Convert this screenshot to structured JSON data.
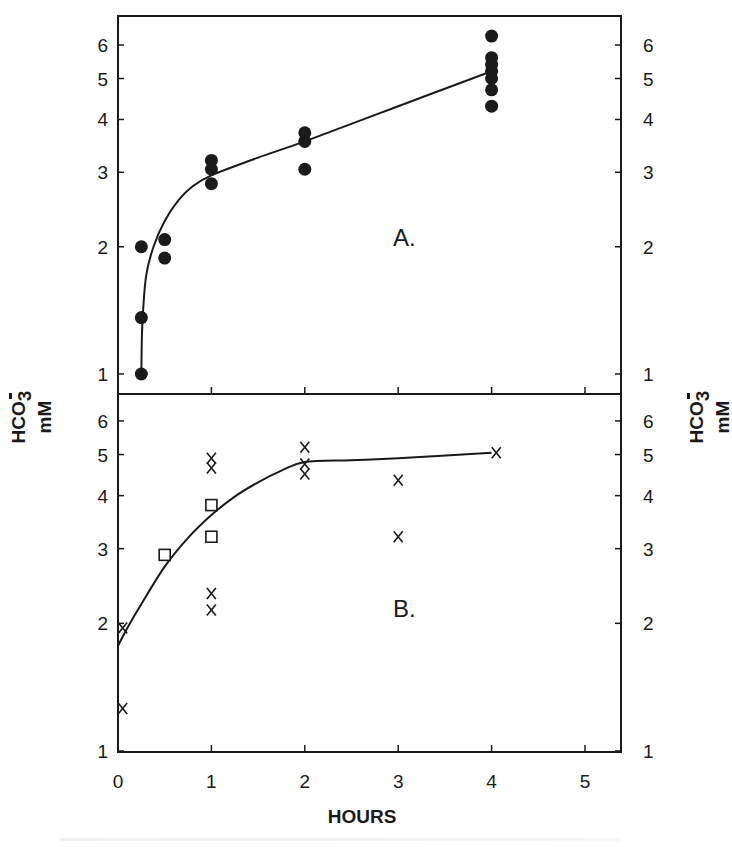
{
  "figure": {
    "x_axis": {
      "label": "HOURS",
      "ticks": [
        "0",
        "1",
        "2",
        "3",
        "4",
        "5"
      ]
    },
    "y_axis": {
      "label_main": "HCO",
      "label_sub": "3",
      "label_sup": "−",
      "label_unit": "mM",
      "ticks": [
        "1",
        "2",
        "3",
        "4",
        "5",
        "6"
      ]
    },
    "panel_a": {
      "label": "A."
    },
    "panel_b": {
      "label": "B."
    }
  },
  "chart_data": [
    {
      "type": "scatter",
      "title": "A.",
      "xlabel": "HOURS",
      "ylabel": "HCO3− mM",
      "yscale": "log",
      "xlim": [
        0,
        5.2
      ],
      "ylim": [
        0.95,
        6.8
      ],
      "x_ticks": [
        0,
        1,
        2,
        3,
        4,
        5
      ],
      "y_ticks": [
        1,
        2,
        3,
        4,
        5,
        6
      ],
      "grid": false,
      "series": [
        {
          "name": "filled circles",
          "marker": "filled-circle",
          "points": [
            [
              0.25,
              1.0
            ],
            [
              0.25,
              1.36
            ],
            [
              0.25,
              2.0
            ],
            [
              0.5,
              2.08
            ],
            [
              0.5,
              1.88
            ],
            [
              1.0,
              3.2
            ],
            [
              1.0,
              3.05
            ],
            [
              1.0,
              2.82
            ],
            [
              2.0,
              3.72
            ],
            [
              2.0,
              3.55
            ],
            [
              2.0,
              3.05
            ],
            [
              4.0,
              6.3
            ],
            [
              4.0,
              5.6
            ],
            [
              4.0,
              5.4
            ],
            [
              4.0,
              5.2
            ],
            [
              4.0,
              5.0
            ],
            [
              4.0,
              4.7
            ],
            [
              4.0,
              4.3
            ]
          ]
        },
        {
          "name": "fit curve",
          "marker": "line",
          "points": [
            [
              0.25,
              1.0
            ],
            [
              0.26,
              1.3
            ],
            [
              0.3,
              1.7
            ],
            [
              0.38,
              2.0
            ],
            [
              0.5,
              2.3
            ],
            [
              0.65,
              2.58
            ],
            [
              0.8,
              2.78
            ],
            [
              1.0,
              2.95
            ],
            [
              1.5,
              3.25
            ],
            [
              2.0,
              3.55
            ],
            [
              3.0,
              4.3
            ],
            [
              4.0,
              5.2
            ]
          ]
        }
      ]
    },
    {
      "type": "scatter",
      "title": "B.",
      "xlabel": "HOURS",
      "ylabel": "HCO3− mM",
      "yscale": "log",
      "xlim": [
        0,
        5.2
      ],
      "ylim": [
        1,
        6.8
      ],
      "x_ticks": [
        0,
        1,
        2,
        3,
        4,
        5
      ],
      "y_ticks": [
        1,
        2,
        3,
        4,
        5,
        6
      ],
      "grid": false,
      "series": [
        {
          "name": "x marks",
          "marker": "x",
          "points": [
            [
              0.05,
              1.95
            ],
            [
              0.05,
              1.26
            ],
            [
              1.0,
              4.9
            ],
            [
              1.0,
              4.65
            ],
            [
              1.0,
              2.35
            ],
            [
              1.0,
              2.15
            ],
            [
              2.0,
              5.2
            ],
            [
              2.0,
              4.75
            ],
            [
              2.0,
              4.5
            ],
            [
              3.0,
              4.35
            ],
            [
              3.0,
              3.2
            ],
            [
              4.05,
              5.05
            ]
          ]
        },
        {
          "name": "open squares",
          "marker": "open-square",
          "points": [
            [
              0.5,
              2.9
            ],
            [
              1.0,
              3.8
            ],
            [
              1.0,
              3.2
            ]
          ]
        },
        {
          "name": "fit curve",
          "marker": "line",
          "points": [
            [
              0.0,
              1.77
            ],
            [
              0.1,
              1.95
            ],
            [
              0.25,
              2.22
            ],
            [
              0.5,
              2.72
            ],
            [
              0.75,
              3.18
            ],
            [
              1.0,
              3.6
            ],
            [
              1.25,
              3.98
            ],
            [
              1.5,
              4.3
            ],
            [
              1.75,
              4.58
            ],
            [
              2.0,
              4.8
            ],
            [
              2.5,
              4.85
            ],
            [
              3.0,
              4.9
            ],
            [
              4.0,
              5.05
            ]
          ]
        }
      ]
    }
  ]
}
